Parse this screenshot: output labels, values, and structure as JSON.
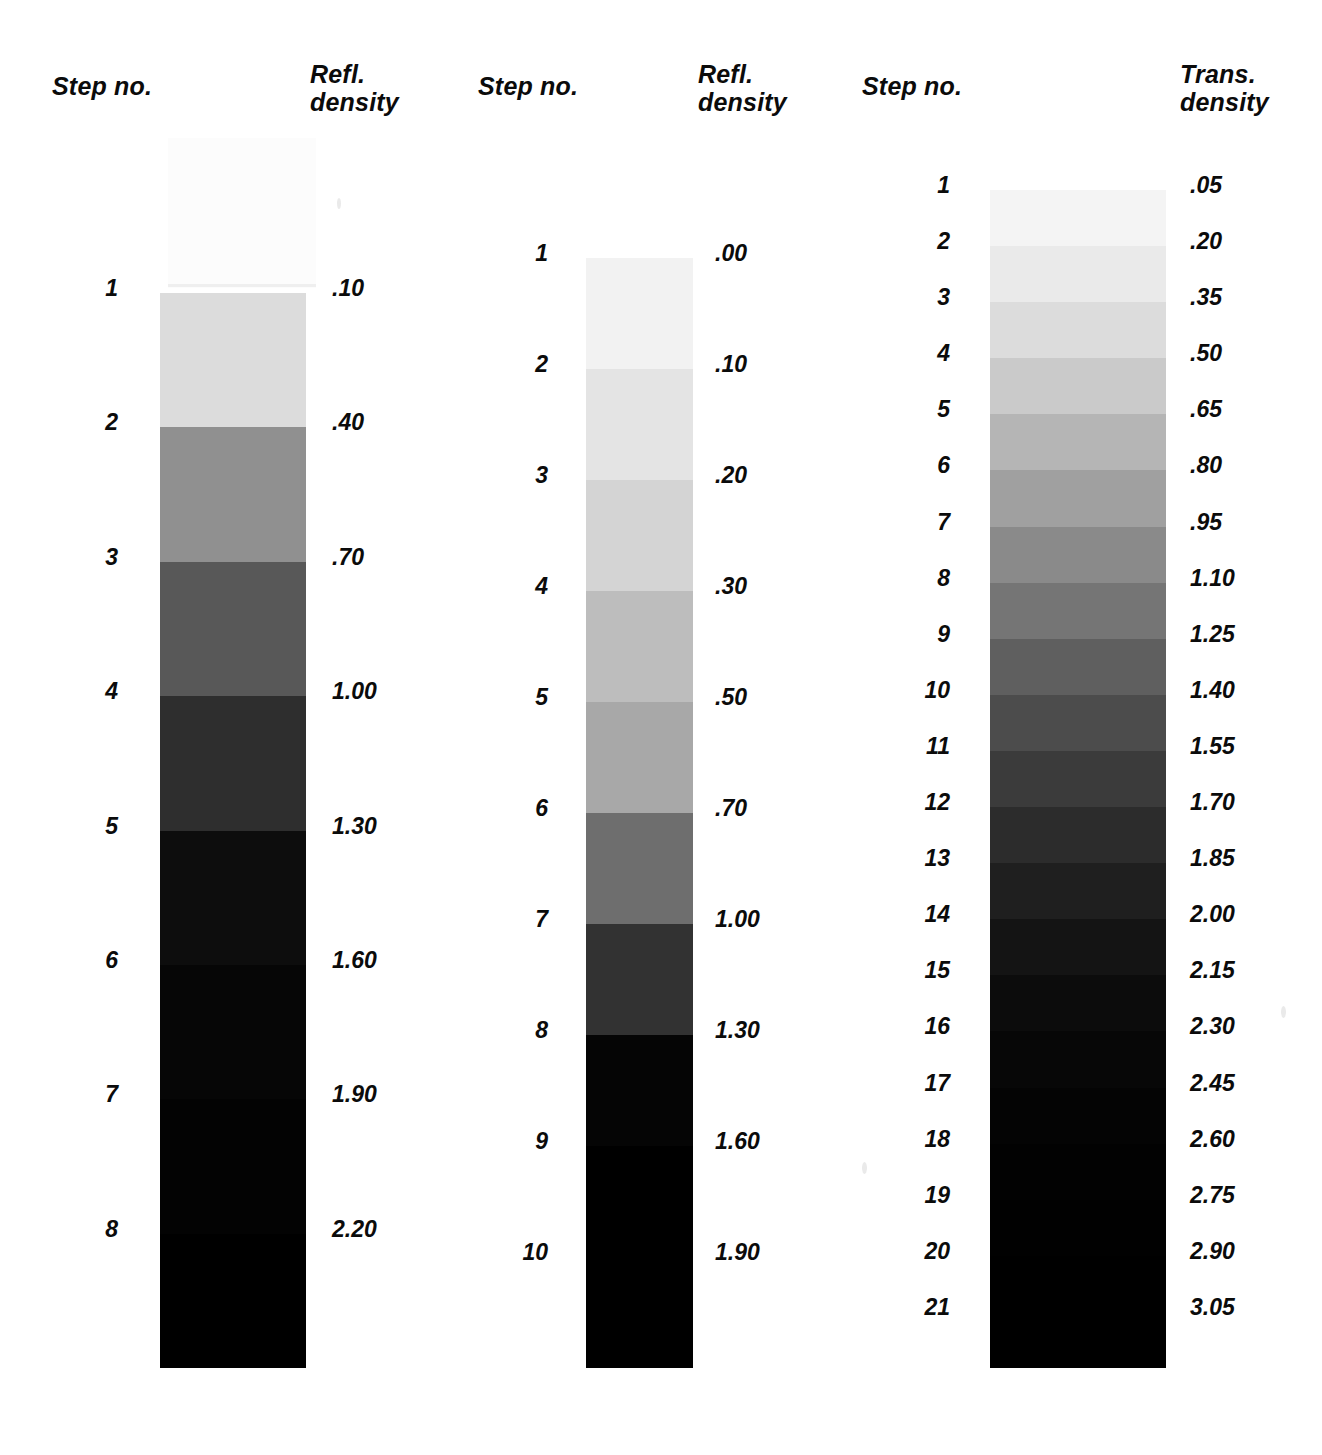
{
  "figure": {
    "background": "#ffffff",
    "ink_color": "#0b0b0b"
  },
  "chart_data": {
    "type": "table",
    "columns": [
      "Step no.",
      "Refl. density",
      "Step no.",
      "Refl. density",
      "Step no.",
      "Trans. density"
    ],
    "scales": [
      {
        "id": "scale-1",
        "step_header": "Step no.",
        "density_header": "Refl.\ndensity",
        "density_header_line1": "Refl.",
        "density_header_line2": "density",
        "density_type": "reflection",
        "step_count": 8,
        "increment": 0.3,
        "steps": [
          "1",
          "2",
          "3",
          "4",
          "5",
          "6",
          "7",
          "8"
        ],
        "densities": [
          ".10",
          ".40",
          ".70",
          "1.00",
          "1.30",
          "1.60",
          "1.90",
          "2.20"
        ],
        "values": [
          0.1,
          0.4,
          0.7,
          1.0,
          1.3,
          1.6,
          1.9,
          2.2
        ],
        "patch_colors": [
          "#dcdcdc",
          "#909090",
          "#585858",
          "#2e2e2e",
          "#0d0d0d",
          "#060606",
          "#030303",
          "#000000"
        ],
        "strip": {
          "left": 160,
          "top": 293,
          "width": 146,
          "height": 1075
        },
        "label_left_x": 118,
        "label_right_x": 332,
        "header_left_x": 52,
        "header_right_x": 310,
        "header_top": 72
      },
      {
        "id": "scale-2",
        "step_header": "Step no.",
        "density_header": "Refl.\ndensity",
        "density_header_line1": "Refl.",
        "density_header_line2": "density",
        "density_type": "reflection",
        "step_count": 10,
        "increment": 0.2,
        "steps": [
          "1",
          "2",
          "3",
          "4",
          "5",
          "6",
          "7",
          "8",
          "9",
          "10"
        ],
        "densities": [
          ".00",
          ".10",
          ".20",
          ".30",
          ".50",
          ".70",
          "1.00",
          "1.30",
          "1.60",
          "1.90"
        ],
        "values": [
          0.0,
          0.1,
          0.2,
          0.3,
          0.5,
          0.7,
          1.0,
          1.3,
          1.6,
          1.9
        ],
        "patch_colors": [
          "#f2f2f2",
          "#e4e4e4",
          "#d4d4d4",
          "#bdbdbd",
          "#a8a8a8",
          "#6e6e6e",
          "#323232",
          "#050505",
          "#000000",
          "#000000"
        ],
        "strip": {
          "left": 586,
          "top": 258,
          "width": 107,
          "height": 1110
        },
        "label_left_x": 548,
        "label_right_x": 715,
        "header_left_x": 478,
        "header_right_x": 698,
        "header_top": 72
      },
      {
        "id": "scale-3",
        "step_header": "Step no.",
        "density_header": "Trans.\ndensity",
        "density_header_line1": "Trans.",
        "density_header_line2": "density",
        "density_type": "transmission",
        "step_count": 21,
        "increment": 0.15,
        "steps": [
          "1",
          "2",
          "3",
          "4",
          "5",
          "6",
          "7",
          "8",
          "9",
          "10",
          "11",
          "12",
          "13",
          "14",
          "15",
          "16",
          "17",
          "18",
          "19",
          "20",
          "21"
        ],
        "densities": [
          ".05",
          ".20",
          ".35",
          ".50",
          ".65",
          ".80",
          ".95",
          "1.10",
          "1.25",
          "1.40",
          "1.55",
          "1.70",
          "1.85",
          "2.00",
          "2.15",
          "2.30",
          "2.45",
          "2.60",
          "2.75",
          "2.90",
          "3.05"
        ],
        "values": [
          0.05,
          0.2,
          0.35,
          0.5,
          0.65,
          0.8,
          0.95,
          1.1,
          1.25,
          1.4,
          1.55,
          1.7,
          1.85,
          2.0,
          2.15,
          2.3,
          2.45,
          2.6,
          2.75,
          2.9,
          3.05
        ],
        "patch_colors": [
          "#f4f4f4",
          "#eaeaea",
          "#dcdcdc",
          "#cacaca",
          "#b5b5b5",
          "#a0a0a0",
          "#8a8a8a",
          "#757575",
          "#5f5f5f",
          "#4c4c4c",
          "#3b3b3b",
          "#2c2c2c",
          "#1f1f1f",
          "#141414",
          "#0c0c0c",
          "#070707",
          "#040404",
          "#020202",
          "#010101",
          "#000000",
          "#000000"
        ],
        "strip": {
          "left": 990,
          "top": 190,
          "width": 176,
          "height": 1178
        },
        "label_left_x": 950,
        "label_right_x": 1190,
        "header_left_x": 862,
        "header_right_x": 1180,
        "header_top": 72
      }
    ]
  }
}
